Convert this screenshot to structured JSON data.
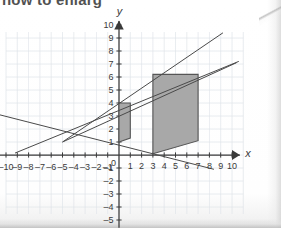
{
  "page": {
    "header_text": "how to enlarg",
    "paper_color": "#fdfdfd",
    "ink_color": "#3a3a3a",
    "grid_color": "#dfe4ea",
    "shape_fill": "#a8a8a8",
    "shape_stroke": "#555555"
  },
  "chart_data": {
    "type": "scatter",
    "title": "",
    "xlabel": "x",
    "ylabel": "y",
    "grid": true,
    "legend": "none",
    "xlim": [
      -11,
      11
    ],
    "ylim": [
      -5.8,
      10.5
    ],
    "xticks": [
      -10,
      -9,
      -8,
      -7,
      -6,
      -5,
      -4,
      -3,
      -2,
      -1,
      0,
      1,
      2,
      3,
      4,
      5,
      6,
      7,
      8,
      9,
      10
    ],
    "yticks": [
      -5,
      -4,
      -3,
      -2,
      -1,
      0,
      1,
      2,
      3,
      4,
      5,
      6,
      7,
      8,
      9,
      10
    ],
    "xtick_labels": [
      "-10",
      "-9",
      "-8",
      "-7",
      "-6",
      "-5",
      "-4",
      "-3",
      "-2",
      "-1",
      "0",
      "1",
      "2",
      "3",
      "4",
      "5",
      "6",
      "7",
      "8",
      "9",
      "10"
    ],
    "ytick_labels": [
      "-5",
      "-4",
      "-3",
      "-2",
      "-1",
      "0",
      "1",
      "2",
      "3",
      "4",
      "5",
      "6",
      "7",
      "8",
      "9",
      "10"
    ],
    "shapes": [
      {
        "name": "object-quadrilateral-small",
        "points": [
          [
            0,
            1
          ],
          [
            1,
            1.3
          ],
          [
            1,
            4
          ],
          [
            0,
            4
          ]
        ],
        "fill": "#a8a8a8"
      },
      {
        "name": "image-quadrilateral-large",
        "points": [
          [
            3,
            0.1
          ],
          [
            7,
            1.1
          ],
          [
            7,
            6.2
          ],
          [
            3,
            6.2
          ]
        ],
        "fill": "#a8a8a8"
      }
    ],
    "rays": [
      {
        "name": "ray-top",
        "from": [
          -5,
          1
        ],
        "to": [
          9.2,
          9.4
        ]
      },
      {
        "name": "ray-upper-mid",
        "from": [
          -5,
          1
        ],
        "to": [
          10.4,
          7.1
        ]
      },
      {
        "name": "ray-lower",
        "from": [
          -10.6,
          3.1
        ],
        "to": [
          8.4,
          -1.1
        ]
      },
      {
        "name": "ray-bottom",
        "from": [
          -9.2,
          0.15
        ],
        "to": [
          10.6,
          7.2
        ]
      }
    ],
    "center_of_enlargement": [
      -5,
      1
    ]
  }
}
